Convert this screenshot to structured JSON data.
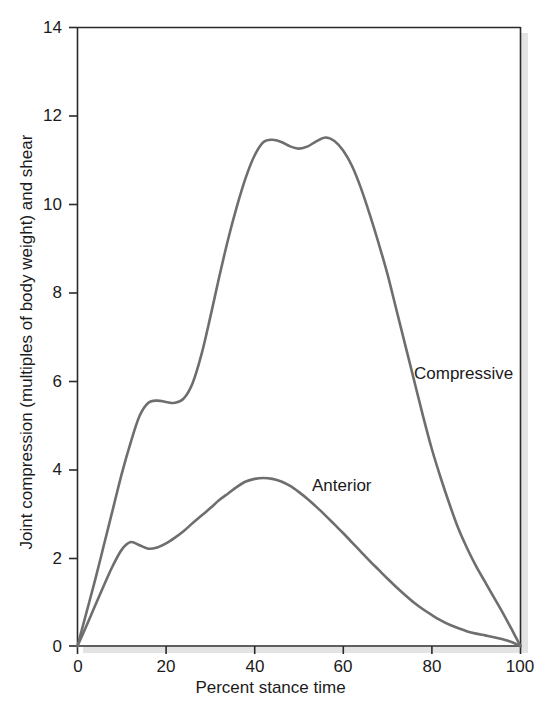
{
  "chart_data": {
    "type": "line",
    "title": "",
    "subtitle": "",
    "xlabel": "Percent stance time",
    "ylabel": "Joint compression (multiples of body weight) and shear",
    "xlim": [
      0,
      100
    ],
    "ylim": [
      0,
      14
    ],
    "xticks": [
      0,
      20,
      40,
      60,
      80,
      100
    ],
    "yticks": [
      0,
      2,
      4,
      6,
      8,
      10,
      12,
      14
    ],
    "xtick_labels": [
      "0",
      "20",
      "40",
      "60",
      "80",
      "100"
    ],
    "ytick_labels": [
      "0",
      "2",
      "4",
      "6",
      "8",
      "10",
      "12",
      "14"
    ],
    "grid": false,
    "legend_position": "inline-annotations",
    "line_color": "#6e6e6e",
    "axis_color": "#2a2a2a",
    "background_color": "#ffffff",
    "series": [
      {
        "name": "Compressive",
        "label": "Compressive",
        "color": "#6e6e6e",
        "annotation": {
          "text": "Compressive",
          "x": 76,
          "y": 6.35
        },
        "x": [
          0,
          2,
          4,
          6,
          8,
          10,
          12,
          14,
          16,
          18,
          20,
          22,
          24,
          26,
          28,
          30,
          32,
          34,
          36,
          38,
          40,
          42,
          44,
          46,
          48,
          50,
          52,
          54,
          56,
          58,
          60,
          62,
          64,
          66,
          68,
          70,
          72,
          74,
          76,
          78,
          80,
          82,
          84,
          86,
          88,
          90,
          92,
          94,
          96,
          98,
          100
        ],
        "y": [
          0.0,
          0.75,
          1.5,
          2.3,
          3.1,
          3.9,
          4.6,
          5.2,
          5.5,
          5.55,
          5.52,
          5.5,
          5.6,
          5.95,
          6.6,
          7.45,
          8.35,
          9.2,
          9.95,
          10.6,
          11.1,
          11.4,
          11.45,
          11.4,
          11.3,
          11.25,
          11.3,
          11.42,
          11.5,
          11.42,
          11.2,
          10.85,
          10.35,
          9.75,
          9.1,
          8.4,
          7.6,
          6.8,
          6.0,
          5.2,
          4.45,
          3.8,
          3.2,
          2.65,
          2.2,
          1.8,
          1.45,
          1.1,
          0.75,
          0.38,
          0.0
        ]
      },
      {
        "name": "Anterior",
        "label": "Anterior",
        "color": "#6e6e6e",
        "annotation": {
          "text": "Anterior",
          "x": 53,
          "y": 3.5
        },
        "x": [
          0,
          2,
          4,
          6,
          8,
          10,
          12,
          14,
          16,
          18,
          20,
          22,
          24,
          26,
          28,
          30,
          32,
          34,
          36,
          38,
          40,
          42,
          44,
          46,
          48,
          50,
          52,
          54,
          56,
          58,
          60,
          62,
          64,
          66,
          68,
          70,
          72,
          74,
          76,
          78,
          80,
          82,
          84,
          86,
          88,
          90,
          92,
          94,
          96,
          98,
          100
        ],
        "y": [
          0.0,
          0.45,
          0.92,
          1.38,
          1.82,
          2.18,
          2.35,
          2.28,
          2.2,
          2.23,
          2.32,
          2.45,
          2.6,
          2.78,
          2.95,
          3.12,
          3.3,
          3.45,
          3.6,
          3.72,
          3.78,
          3.8,
          3.78,
          3.72,
          3.62,
          3.48,
          3.32,
          3.14,
          2.95,
          2.75,
          2.55,
          2.34,
          2.13,
          1.92,
          1.72,
          1.52,
          1.33,
          1.15,
          0.98,
          0.83,
          0.7,
          0.58,
          0.48,
          0.4,
          0.33,
          0.28,
          0.24,
          0.2,
          0.15,
          0.09,
          0.0
        ]
      }
    ]
  },
  "labels": {
    "xaxis_title": "Percent stance time",
    "yaxis_title": "Joint compression (multiples of body weight) and shear",
    "compressive": "Compressive",
    "anterior": "Anterior"
  }
}
